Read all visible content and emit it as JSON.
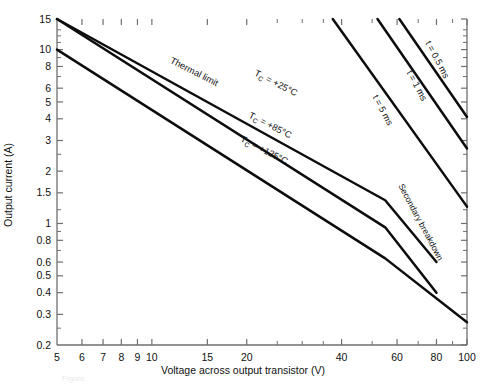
{
  "chart_data": {
    "type": "line",
    "title": "",
    "xlabel": "Voltage across output transistor (V)",
    "ylabel": "Output current (A)",
    "xscale": "log",
    "yscale": "log",
    "xlim": [
      5,
      100
    ],
    "ylim": [
      0.2,
      15
    ],
    "grid": false,
    "legend_position": "inline-labels",
    "xticks": [
      5,
      6,
      7,
      8,
      9,
      10,
      15,
      20,
      40,
      60,
      80,
      100
    ],
    "xtick_labels": [
      "5",
      "6",
      "7",
      "8",
      "9",
      "10",
      "15",
      "20",
      "40",
      "60",
      "80",
      "100"
    ],
    "xticks_minor": [
      25,
      30,
      35,
      50,
      70,
      90
    ],
    "yticks": [
      15,
      10,
      8,
      6,
      5,
      4,
      3,
      2,
      1.5,
      1,
      0.8,
      0.6,
      0.5,
      0.4,
      0.3,
      0.2
    ],
    "ytick_labels": [
      "15",
      "10",
      "8",
      "6",
      "5",
      "4",
      "3",
      "2",
      "1.5",
      "1",
      "0.8",
      "0.6",
      "0.5",
      "0.4",
      "0.3",
      "0.2"
    ],
    "yticks_minor": [
      13,
      12,
      11,
      9,
      7,
      2.5,
      1.2,
      0.9,
      0.7,
      0.25
    ],
    "series": [
      {
        "name": "Thermal limit / Tc = +25 C",
        "label": "T_C = +25°C",
        "label_text": "T",
        "points": [
          [
            5,
            15
          ],
          [
            55,
            1.36
          ],
          [
            80,
            0.6
          ]
        ]
      },
      {
        "name": "Thermal limit / Tc = +85 C",
        "label": "T_C = +85°C",
        "points": [
          [
            5,
            15
          ],
          [
            55,
            0.95
          ],
          [
            80,
            0.4
          ]
        ]
      },
      {
        "name": "Thermal limit / Tc = +125 C",
        "label": "T_C = +125°C",
        "points": [
          [
            5,
            10
          ],
          [
            55,
            0.63
          ],
          [
            100,
            0.27
          ]
        ]
      },
      {
        "name": "Pulse t = 5 ms",
        "label": "t = 5 ms",
        "points": [
          [
            37.5,
            15
          ],
          [
            100,
            1.25
          ]
        ]
      },
      {
        "name": "Pulse t = 1 ms",
        "label": "t = 1 ms",
        "points": [
          [
            52,
            15
          ],
          [
            100,
            2.7
          ]
        ]
      },
      {
        "name": "Pulse t = 0.5 ms",
        "label": "t = 0.5 ms",
        "points": [
          [
            61,
            15
          ],
          [
            100,
            4.1
          ]
        ]
      }
    ],
    "annotations": [
      {
        "name": "thermal-limit",
        "text": "Thermal limit",
        "x": 13.5,
        "y": 7.2,
        "rotation": 27
      },
      {
        "name": "tc-25",
        "text": "T",
        "sub": "C",
        "rest": " = +25°C",
        "x": 24.5,
        "y": 6.2,
        "rotation": 27
      },
      {
        "name": "tc-85",
        "text": "T",
        "sub": "C",
        "rest": " = +85°C",
        "x": 23.5,
        "y": 3.55,
        "rotation": 27
      },
      {
        "name": "tc-125",
        "text": "T",
        "sub": "C",
        "rest": " = +125°C",
        "x": 22.5,
        "y": 2.55,
        "rotation": 27
      },
      {
        "name": "t-5ms",
        "text": "t = 5 ms",
        "x": 53,
        "y": 4.4,
        "rotation": 62
      },
      {
        "name": "t-1ms",
        "text": "t = 1 ms",
        "x": 68,
        "y": 6.1,
        "rotation": 62
      },
      {
        "name": "t-0p5ms",
        "text": "t = 0.5 ms",
        "x": 79,
        "y": 8.6,
        "rotation": 62
      },
      {
        "name": "secondary-breakdown",
        "text": "Secondary breakdown",
        "x": 70,
        "y": 1.0,
        "rotation": 62
      }
    ],
    "colors": {
      "curve": "#0d0d0d",
      "axis": "#6f6f6f",
      "background": "#ffffff",
      "text": "#111111"
    }
  },
  "caption": {
    "text": "Figure"
  }
}
